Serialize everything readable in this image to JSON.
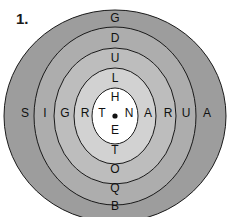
{
  "puzzle": {
    "number_label": "1.",
    "center_marker": "dot",
    "rings": [
      {
        "name": "ring-5-outer",
        "fill": "#9d9d9d"
      },
      {
        "name": "ring-4",
        "fill": "#adadad"
      },
      {
        "name": "ring-3",
        "fill": "#bdbdbd"
      },
      {
        "name": "ring-2",
        "fill": "#d2d2d2"
      },
      {
        "name": "ring-1-center",
        "fill": "#ffffff"
      }
    ],
    "letters": {
      "top": [
        "G",
        "D",
        "U",
        "L",
        "H"
      ],
      "bottom": [
        "E",
        "T",
        "O",
        "Q",
        "B"
      ],
      "left": [
        "S",
        "I",
        "G",
        "R",
        "T"
      ],
      "right": [
        "N",
        "A",
        "R",
        "U",
        "A"
      ]
    },
    "stroke_color": "#1a1a1a"
  }
}
